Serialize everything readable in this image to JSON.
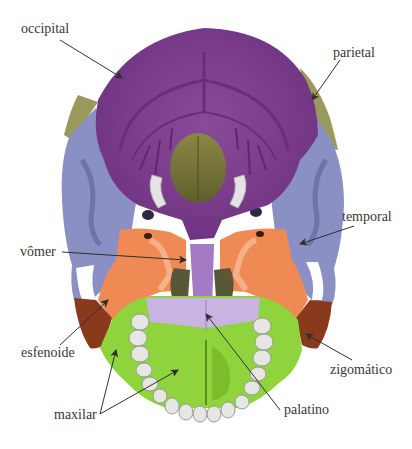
{
  "colors": {
    "occipital": "#7e3f8e",
    "occipital_dark": "#6a2f79",
    "parietal": "#9a9a5c",
    "temporal": "#8a8fc4",
    "temporal_dark": "#6f73a8",
    "sphenoid": "#f08a55",
    "sphenoid_light": "#f6b08a",
    "vomer": "#a57ac4",
    "palatine": "#c9b3e3",
    "maxilla": "#8fd43c",
    "maxilla_dark": "#6fae25",
    "zygomatic": "#8a3a1c",
    "teeth": "#e6e6e2",
    "foramen_magnum": "#7b7a3a",
    "arrow": "#2f2f2f",
    "label_text": "#3a3535"
  },
  "labels": [
    {
      "id": "occipital",
      "text": "occipital"
    },
    {
      "id": "parietal",
      "text": "parietal"
    },
    {
      "id": "vomer",
      "text": "vômer"
    },
    {
      "id": "temporal",
      "text": "temporal"
    },
    {
      "id": "sphenoid",
      "text": "esfenoide"
    },
    {
      "id": "zygomatic",
      "text": "zigomático"
    },
    {
      "id": "maxilla",
      "text": "maxilar"
    },
    {
      "id": "palatine",
      "text": "palatino"
    }
  ]
}
